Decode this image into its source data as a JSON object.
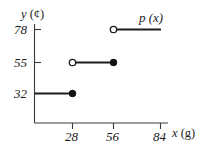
{
  "figure": {
    "name": "step-function-graph",
    "curve_label": "p (x)",
    "line_color": "#1c1c1c",
    "axis_color": "#3a3a3a"
  },
  "axes": {
    "y": {
      "title": "y (¢)",
      "title_var": "y",
      "title_unit": "(¢)",
      "ticks": [
        {
          "value": 32,
          "label": "32"
        },
        {
          "value": 55,
          "label": "55"
        },
        {
          "value": 78,
          "label": "78"
        }
      ]
    },
    "x": {
      "title": "x (g)",
      "title_var": "x",
      "title_unit": "(g)",
      "ticks": [
        {
          "value": 28,
          "label": "28"
        },
        {
          "value": 56,
          "label": "56"
        },
        {
          "value": 84,
          "label": "84"
        }
      ]
    }
  },
  "chart_data": {
    "type": "line",
    "subtype": "step-function",
    "title": "",
    "xlabel": "x (g)",
    "ylabel": "y (¢)",
    "xlim": [
      0,
      95
    ],
    "ylim": [
      0,
      92
    ],
    "grid": false,
    "legend": "none",
    "annotations": [
      {
        "text": "p (x)",
        "x": 72,
        "y": 86
      }
    ],
    "xticks": [
      28,
      56,
      84
    ],
    "xticklabels": [
      "28",
      "56",
      "84"
    ],
    "yticks": [
      32,
      55,
      78
    ],
    "yticklabels": [
      "32",
      "55",
      "78"
    ],
    "series": [
      {
        "name": "p(x)",
        "steps": [
          {
            "y": 32,
            "x_start": 0,
            "x_end": 28,
            "left_endpoint": "none",
            "right_endpoint": "closed"
          },
          {
            "y": 55,
            "x_start": 28,
            "x_end": 56,
            "left_endpoint": "open",
            "right_endpoint": "closed"
          },
          {
            "y": 78,
            "x_start": 56,
            "x_end": 84,
            "left_endpoint": "open",
            "right_endpoint": "none"
          }
        ]
      }
    ]
  }
}
